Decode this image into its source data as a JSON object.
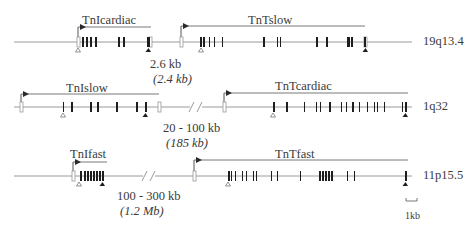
{
  "figure": {
    "rows": [
      {
        "chromosome": "19q13.4",
        "line_y": 42,
        "line_x": [
          14,
          412
        ],
        "genes": [
          {
            "name": "TnIcardiac",
            "label_x": 82,
            "label_y": 14,
            "arrow": {
              "x_start": 151,
              "x_end": 78,
              "y": 27,
              "direction": "left",
              "tss_x": 78
            },
            "open_boxes": [
              78,
              150
            ],
            "exons": [
              [
                82,
                2
              ],
              [
                86,
                2
              ],
              [
                90,
                2
              ],
              [
                95,
                2
              ],
              [
                118,
                2
              ],
              [
                123,
                2
              ],
              [
                147,
                3
              ]
            ],
            "start_codon_x": 78,
            "stop_codon_x": 148
          },
          {
            "name": "TnTslow",
            "label_x": 248,
            "label_y": 14,
            "arrow": {
              "x_start": 181,
              "x_end": 365,
              "y": 26,
              "direction": "right",
              "tss_x": 181
            },
            "open_boxes": [
              181,
              365
            ],
            "exons": [
              [
                200,
                2
              ],
              [
                203,
                2
              ],
              [
                209,
                1
              ],
              [
                214,
                1
              ],
              [
                222,
                1
              ],
              [
                263,
                2
              ],
              [
                277,
                1
              ],
              [
                280,
                1
              ],
              [
                316,
                2
              ],
              [
                326,
                2
              ],
              [
                347,
                3
              ],
              [
                351,
                2
              ],
              [
                364,
                2
              ]
            ],
            "start_codon_x": 201,
            "stop_codon_x": 365
          }
        ],
        "gap": {
          "label": "2.6 kb",
          "label_italic": "(2.4 kb)",
          "x": 150,
          "y": 58
        }
      },
      {
        "chromosome": "1q32",
        "line_y": 107,
        "line_x": [
          14,
          412
        ],
        "genes": [
          {
            "name": "TnIslow",
            "label_x": 66,
            "label_y": 82,
            "arrow": {
              "x_start": 159,
              "x_end": 21,
              "y": 94,
              "direction": "left",
              "tss_x": 21
            },
            "open_boxes": [
              21,
              159
            ],
            "exons": [
              [
                63,
                1
              ],
              [
                71,
                2
              ],
              [
                90,
                2
              ],
              [
                97,
                2
              ],
              [
                116,
                2
              ],
              [
                136,
                2
              ],
              [
                145,
                2
              ]
            ],
            "start_codon_x": 63,
            "stop_codon_x": 145
          },
          {
            "name": "TnTcardiac",
            "label_x": 275,
            "label_y": 80,
            "arrow": {
              "x_start": 224,
              "x_end": 408,
              "y": 93,
              "direction": "right",
              "tss_x": 224
            },
            "open_boxes": [
              224
            ],
            "exons": [
              [
                273,
                2
              ],
              [
                286,
                2
              ],
              [
                304,
                1
              ],
              [
                316,
                1
              ],
              [
                320,
                1
              ],
              [
                329,
                2
              ],
              [
                341,
                1
              ],
              [
                346,
                1
              ],
              [
                352,
                2
              ],
              [
                359,
                1
              ],
              [
                367,
                1
              ],
              [
                374,
                1
              ],
              [
                377,
                1
              ],
              [
                384,
                1
              ],
              [
                402,
                1
              ],
              [
                405,
                2
              ]
            ],
            "start_codon_x": 273,
            "stop_codon_x": 405
          }
        ],
        "break_marks": {
          "x": 195,
          "y": 107
        },
        "gap": {
          "label": "20 - 100 kb",
          "label_italic": "(185 kb)",
          "x": 163,
          "y": 122
        }
      },
      {
        "chromosome": "11p15.5",
        "line_y": 176,
        "line_x": [
          14,
          412
        ],
        "genes": [
          {
            "name": "TnIfast",
            "label_x": 70,
            "label_y": 148,
            "arrow": {
              "x_start": 73,
              "x_end": 107,
              "y": 162,
              "direction": "right",
              "tss_x": 73
            },
            "open_boxes": [
              73
            ],
            "exons": [
              [
                80,
                2
              ],
              [
                84,
                2
              ],
              [
                87,
                2
              ],
              [
                90,
                2
              ],
              [
                93,
                2
              ],
              [
                96,
                2
              ],
              [
                99,
                2
              ],
              [
                102,
                2
              ]
            ],
            "start_codon_x": 79,
            "stop_codon_x": 102
          },
          {
            "name": "TnTfast",
            "label_x": 275,
            "label_y": 148,
            "arrow": {
              "x_start": 194,
              "x_end": 408,
              "y": 160,
              "direction": "right",
              "tss_x": 194
            },
            "open_boxes": [
              194
            ],
            "exons": [
              [
                228,
                2
              ],
              [
                231,
                1
              ],
              [
                235,
                1
              ],
              [
                242,
                1
              ],
              [
                246,
                1
              ],
              [
                253,
                1
              ],
              [
                256,
                1
              ],
              [
                271,
                1
              ],
              [
                277,
                1
              ],
              [
                300,
                1
              ],
              [
                319,
                2
              ],
              [
                322,
                2
              ],
              [
                325,
                2
              ],
              [
                328,
                2
              ],
              [
                331,
                2
              ],
              [
                347,
                1
              ],
              [
                354,
                1
              ],
              [
                405,
                2
              ]
            ],
            "start_codon_x": 228,
            "stop_codon_x": 405
          }
        ],
        "break_marks": {
          "x": 148,
          "y": 176
        },
        "gap": {
          "label": "100 - 300 kb",
          "label_italic": "(1.2 Mb)",
          "x": 117,
          "y": 190
        }
      }
    ],
    "scale_bar": {
      "label": "1kb",
      "x1": 406,
      "x2": 417,
      "y": 201,
      "label_x": 405,
      "label_y": 211
    },
    "colors": {
      "line": "#9a9a9a",
      "exon": "#1e1e1e",
      "open_box": "#9a9a9a",
      "arrow": "#2a2a2a",
      "text": "#3a3a3a"
    }
  }
}
